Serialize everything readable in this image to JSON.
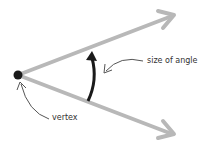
{
  "diagram": {
    "labels": {
      "angle": "size of angle",
      "vertex": "vertex"
    },
    "colors": {
      "ray": "#b8b8b8",
      "arc": "#1a1a1a",
      "pointer": "#555555",
      "vertex_dot": "#1a1a1a"
    }
  }
}
